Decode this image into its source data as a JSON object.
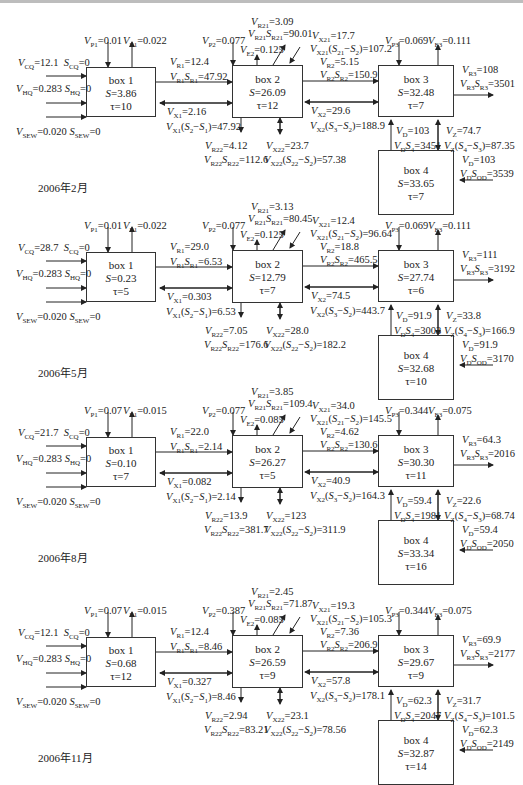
{
  "panels": [
    {
      "date": "2006年2月",
      "inputs": {
        "VCQ": "12.1",
        "SCQ": "0",
        "VHQ": "0.283",
        "SHQ": "0",
        "VSEW": "0.020",
        "SSEW": "0"
      },
      "box1": {
        "name": "box 1",
        "S": "3.86",
        "tau": "10",
        "VP1": "0.01",
        "VE1": "0.022"
      },
      "link12": {
        "VR1": "12.4",
        "VR1SR1": "47.92",
        "VX1": "2.16",
        "VX1S": "47.92"
      },
      "box2": {
        "name": "box 2",
        "S": "26.09",
        "tau": "12",
        "VP2": "0.077",
        "VE2": "0.125",
        "VR21": "3.09",
        "VR21SR21": "90.01",
        "VX21": "17.7",
        "VX21S": "107.2",
        "VR22": "4.12",
        "VR22SR22": "112.6",
        "VX22": "23.7",
        "VX22S": "57.38"
      },
      "link23": {
        "VR2": "5.15",
        "VR2SR2": "150.9",
        "VX2": "29.6",
        "VX2S": "188.9"
      },
      "box3": {
        "name": "box 3",
        "S": "32.48",
        "tau": "7",
        "VP3": "0.069",
        "VE3": "0.111",
        "VR3": "108",
        "VR3SR3": "3501"
      },
      "link34": {
        "VD": "103",
        "VDS4": "3451",
        "VZ": "74.7",
        "VZS": "87.35"
      },
      "box4": {
        "name": "box 4",
        "S": "33.65",
        "tau": "7",
        "VD": "103",
        "VDSOD": "3539"
      }
    },
    {
      "date": "2006年5月",
      "inputs": {
        "VCQ": "28.7",
        "SCQ": "0",
        "VHQ": "0.283",
        "SHQ": "0",
        "VSEW": "0.020",
        "SSEW": "0"
      },
      "box1": {
        "name": "box 1",
        "S": "0.23",
        "tau": "5",
        "VP1": "0.01",
        "VE1": "0.022"
      },
      "link12": {
        "VR1": "29.0",
        "VR1SR1": "6.53",
        "VX1": "0.303",
        "VX1S": "6.53"
      },
      "box2": {
        "name": "box 2",
        "S": "12.79",
        "tau": "7",
        "VP2": "0.077",
        "VE2": "0.125",
        "VR21": "3.13",
        "VR21SR21": "80.45",
        "VX21": "12.4",
        "VX21S": "96.64",
        "VR22": "7.05",
        "VR22SR22": "176.6",
        "VX22": "28.0",
        "VX22S": "182.2"
      },
      "link23": {
        "VR2": "18.8",
        "VR2SR2": "465.5",
        "VX2": "74.5",
        "VX2S": "443.7"
      },
      "box3": {
        "name": "box 3",
        "S": "27.74",
        "tau": "6",
        "VP3": "0.069",
        "VE3": "0.111",
        "VR3": "111",
        "VR3SR3": "3192"
      },
      "link34": {
        "VD": "91.9",
        "VDS4": "3003",
        "VZ": "33.8",
        "VZS": "166.9"
      },
      "box4": {
        "name": "box 4",
        "S": "32.68",
        "tau": "10",
        "VD": "91.9",
        "VDSOD": "3170"
      }
    },
    {
      "date": "2006年8月",
      "inputs": {
        "VCQ": "21.7",
        "SCQ": "0",
        "VHQ": "0.283",
        "SHQ": "0",
        "VSEW": "0.020",
        "SSEW": "0"
      },
      "box1": {
        "name": "box 1",
        "S": "0.10",
        "tau": "7",
        "VP1": "0.07",
        "VE1": "0.015"
      },
      "link12": {
        "VR1": "22.0",
        "VR1SR1": "2.14",
        "VX1": "0.082",
        "VX1S": "2.14"
      },
      "box2": {
        "name": "box 2",
        "S": "26.27",
        "tau": "5",
        "VP2": "0.077",
        "VE2": "0.085",
        "VR21": "3.85",
        "VR21SR21": "109.4",
        "VX21": "34.0",
        "VX21S": "145.5",
        "VR22": "13.9",
        "VR22SR22": "381.7",
        "VX22": "123",
        "VX22S": "311.9"
      },
      "link23": {
        "VR2": "4.62",
        "VR2SR2": "130.6",
        "VX2": "40.9",
        "VX2S": "164.3"
      },
      "box3": {
        "name": "box 3",
        "S": "30.30",
        "tau": "11",
        "VP3": "0.344",
        "VE3": "0.075",
        "VR3": "64.3",
        "VR3SR3": "2016"
      },
      "link34": {
        "VD": "59.4",
        "VDS4": "1981",
        "VZ": "22.6",
        "VZS": "68.74"
      },
      "box4": {
        "name": "box 4",
        "S": "33.34",
        "tau": "16",
        "VD": "59.4",
        "VDSOD": "2050"
      }
    },
    {
      "date": "2006年11月",
      "inputs": {
        "VCQ": "12.1",
        "SCQ": "0",
        "VHQ": "0.283",
        "SHQ": "0",
        "VSEW": "0.020",
        "SSEW": "0"
      },
      "box1": {
        "name": "box 1",
        "S": "0.68",
        "tau": "12",
        "VP1": "0.07",
        "VE1": "0.015"
      },
      "link12": {
        "VR1": "12.4",
        "VR1SR1": "8.46",
        "VX1": "0.327",
        "VX1S": "8.46"
      },
      "box2": {
        "name": "box 2",
        "S": "26.59",
        "tau": "9",
        "VP2": "0.387",
        "VE2": "0.085",
        "VR21": "2.45",
        "VR21SR21": "71.87",
        "VX21": "19.3",
        "VX21S": "105.3",
        "VR22": "2.94",
        "VR22SR22": "83.21",
        "VX22": "23.1",
        "VX22S": "78.56"
      },
      "link23": {
        "VR2": "7.36",
        "VR2SR2": "206.9",
        "VX2": "57.8",
        "VX2S": "178.1"
      },
      "box3": {
        "name": "box 3",
        "S": "29.67",
        "tau": "9",
        "VP3": "0.344",
        "VE3": "0.075",
        "VR3": "69.9",
        "VR3SR3": "2177"
      },
      "link34": {
        "VD": "62.3",
        "VDS4": "2047",
        "VZ": "31.7",
        "VZS": "101.5"
      },
      "box4": {
        "name": "box 4",
        "S": "32.87",
        "tau": "14",
        "VD": "62.3",
        "VDSOD": "2149"
      }
    }
  ]
}
